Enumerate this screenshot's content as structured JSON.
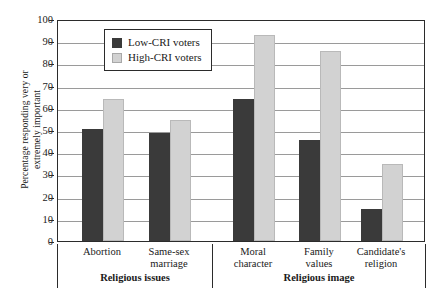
{
  "chart_data": {
    "type": "bar",
    "title": "",
    "xlabel": "",
    "ylabel": "Percentage responding very or extremely important",
    "ylabel_line1": "Percentage responding very or",
    "ylabel_line2": "extremely important",
    "ylim": [
      0,
      100
    ],
    "ytick_step": 10,
    "yticks": [
      0,
      10,
      20,
      30,
      40,
      50,
      60,
      70,
      80,
      90,
      100
    ],
    "grid": true,
    "legend_position": "top-center-inside",
    "categories": [
      "Abortion",
      "Same-sex marriage",
      "Moral character",
      "Family values",
      "Candidate's religion"
    ],
    "category_label_lines": [
      [
        "Abortion"
      ],
      [
        "Same-sex",
        "marriage"
      ],
      [
        "Moral",
        "character"
      ],
      [
        "Family",
        "values"
      ],
      [
        "Candidate's",
        "religion"
      ]
    ],
    "groups": [
      {
        "label": "Religious issues",
        "categories": [
          "Abortion",
          "Same-sex marriage"
        ]
      },
      {
        "label": "Religious image",
        "categories": [
          "Moral character",
          "Family values",
          "Candidate's religion"
        ]
      }
    ],
    "series": [
      {
        "name": "Low-CRI voters",
        "color": "#3a3a3a",
        "values": [
          50.5,
          48.5,
          64,
          45.5,
          14.5
        ]
      },
      {
        "name": "High-CRI voters",
        "color": "#d2d2d2",
        "values": [
          64,
          54.5,
          93,
          85.5,
          34.5
        ]
      }
    ]
  },
  "legend": {
    "items": [
      {
        "label": "Low-CRI voters",
        "swatch": "low"
      },
      {
        "label": "High-CRI voters",
        "swatch": "high"
      }
    ]
  }
}
